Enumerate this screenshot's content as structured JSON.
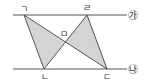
{
  "diagram": {
    "type": "geometry",
    "lines": [
      {
        "label": "㉮",
        "y": 15,
        "x1": 13,
        "x2": 127
      },
      {
        "label": "㉯",
        "y": 69,
        "x1": 13,
        "x2": 127
      }
    ],
    "points": {
      "g": {
        "label": "ㄱ",
        "x": 24,
        "y": 15,
        "lx": 20,
        "ly": 12
      },
      "r": {
        "label": "ㄹ",
        "x": 87,
        "y": 15,
        "lx": 83,
        "ly": 11
      },
      "n": {
        "label": "ㄴ",
        "x": 44,
        "y": 69,
        "lx": 41,
        "ly": 79
      },
      "d": {
        "label": "ㄷ",
        "x": 107,
        "y": 69,
        "lx": 103,
        "ly": 79
      },
      "m": {
        "label": "ㅁ",
        "x": 65,
        "y": 42,
        "lx": 61,
        "ly": 38
      }
    },
    "segments": [
      "ㄱㄴ",
      "ㄱㄷ",
      "ㄹㄴ",
      "ㄹㄷ"
    ],
    "shaded_triangles": [
      "ㄱㄴㅁ",
      "ㄹㅁㄷ"
    ],
    "colors": {
      "shade": "#d4d4d4",
      "stroke": "#555555"
    }
  }
}
